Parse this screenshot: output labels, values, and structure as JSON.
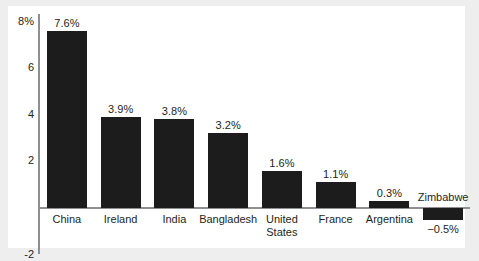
{
  "chart_data": {
    "type": "bar",
    "title": "",
    "subtitle": "",
    "xlabel": "",
    "ylabel": "",
    "categories": [
      "China",
      "Ireland",
      "India",
      "Bangladesh",
      "United States",
      "France",
      "Argentina",
      "Zimbabwe"
    ],
    "values": [
      7.6,
      3.9,
      3.8,
      3.2,
      1.6,
      1.1,
      0.3,
      -0.5
    ],
    "value_labels": [
      "7.6%",
      "3.9%",
      "3.8%",
      "3.2%",
      "1.6%",
      "1.1%",
      "0.3%",
      "−0.5%"
    ],
    "ylim": [
      -2,
      8.6
    ],
    "yticks": [
      8,
      6,
      4,
      2,
      -2
    ],
    "ytick_labels": [
      "8%",
      "6",
      "4",
      "2",
      "-2"
    ],
    "grid": false,
    "legend": null,
    "bar_color": "#1c1c1c",
    "axis_color": "#8d8f92",
    "plot_background": "#ffffff",
    "page_background": "#eeeeee"
  }
}
